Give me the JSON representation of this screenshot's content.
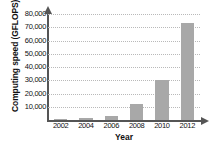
{
  "chart_data": {
    "type": "bar",
    "title": "",
    "xlabel": "Year",
    "ylabel": "Computing speed (GFLOPS)",
    "categories": [
      "2002",
      "2004",
      "2006",
      "2008",
      "2010",
      "2012"
    ],
    "values": [
      300,
      1200,
      2800,
      12000,
      30500,
      73000
    ],
    "ylim": [
      0,
      80000
    ],
    "ytick_labels": [
      "10,000",
      "20,000",
      "30,000",
      "40,000",
      "50,000",
      "60,000",
      "70,000",
      "80,000"
    ],
    "ytick_values": [
      10000,
      20000,
      30000,
      40000,
      50000,
      60000,
      70000,
      80000
    ],
    "grid": true,
    "legend": "none",
    "bar_color": "#a8a8a8",
    "axis_color": "#555555",
    "grid_color": "#b9b9b9",
    "text_color": "#111111"
  }
}
